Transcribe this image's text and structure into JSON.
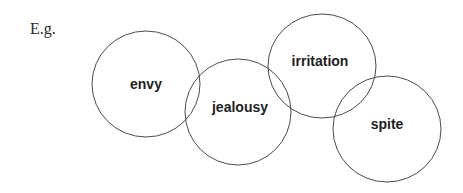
{
  "intro_label": "E.g.",
  "diagram": {
    "type": "overlapping-circles",
    "stroke_color": "#4a4a4a",
    "circles": [
      {
        "label": "envy",
        "cx": 146,
        "cy": 84,
        "rx": 54,
        "ry": 53
      },
      {
        "label": "jealousy",
        "cx": 238,
        "cy": 112,
        "rx": 53,
        "ry": 53
      },
      {
        "label": "irritation",
        "cx": 322,
        "cy": 66,
        "rx": 54,
        "ry": 52
      },
      {
        "label": "spite",
        "cx": 387,
        "cy": 129,
        "rx": 54,
        "ry": 53
      }
    ]
  }
}
